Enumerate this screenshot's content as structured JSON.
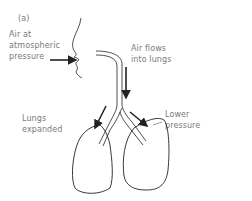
{
  "panel_label": "(a)",
  "labels": {
    "air_at_line1": "Air at",
    "air_at_line2": "atmospheric",
    "air_at_line3": "pressure",
    "air_flows_line1": "Air flows",
    "air_flows_line2": "into lungs",
    "lungs_expanded_line1": "Lungs",
    "lungs_expanded_line2": "expanded",
    "lower_pressure_line1": "Lower",
    "lower_pressure_line2": "pressure"
  },
  "colors": {
    "line": "#222222",
    "text": "#7a7a7a"
  }
}
